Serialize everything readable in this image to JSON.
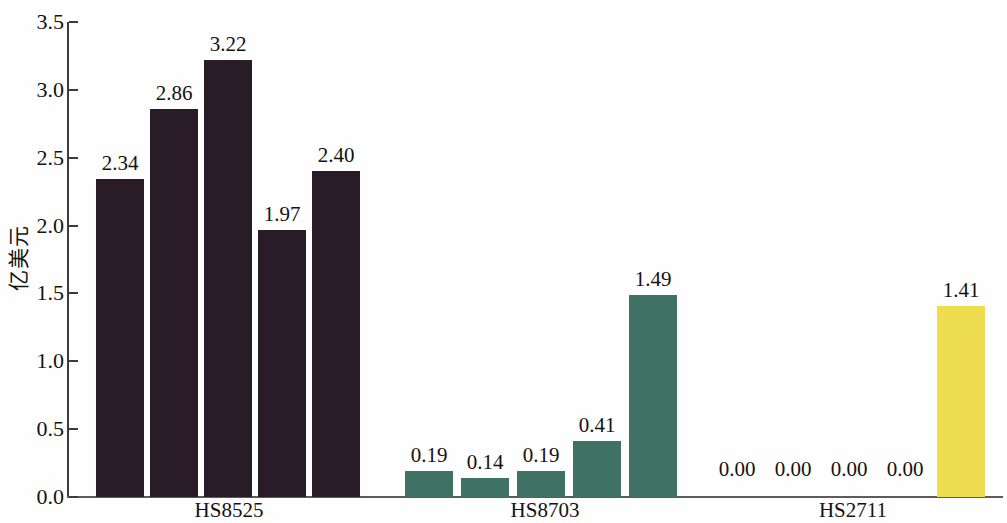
{
  "chart_data": {
    "type": "bar",
    "title": "",
    "subtitle": "",
    "xlabel": "",
    "ylabel": "亿美元",
    "ylim": [
      0.0,
      3.5
    ],
    "ytick_labels": [
      "0.0",
      "0.5",
      "1.0",
      "1.5",
      "2.0",
      "2.5",
      "3.0",
      "3.5"
    ],
    "ytick_values": [
      0.0,
      0.5,
      1.0,
      1.5,
      2.0,
      2.5,
      3.0,
      3.5
    ],
    "grid": false,
    "legend": false,
    "legend_position": "none",
    "categories": [
      "HS8525",
      "HS8703",
      "HS2711"
    ],
    "bars_per_category": 5,
    "groups": [
      {
        "label": "HS8525",
        "color": "#2a1c26",
        "values": [
          2.34,
          2.86,
          3.22,
          1.97,
          2.4
        ],
        "value_labels": [
          "2.34",
          "2.86",
          "3.22",
          "1.97",
          "2.40"
        ]
      },
      {
        "label": "HS8703",
        "color": "#3f7265",
        "values": [
          0.19,
          0.14,
          0.19,
          0.41,
          1.49
        ],
        "value_labels": [
          "0.19",
          "0.14",
          "0.19",
          "0.41",
          "1.49"
        ]
      },
      {
        "label": "HS2711",
        "color": "#eedd4f",
        "values": [
          0.0,
          0.0,
          0.0,
          0.0,
          1.41
        ],
        "value_labels": [
          "0.00",
          "0.00",
          "0.00",
          "0.00",
          "1.41"
        ]
      }
    ]
  }
}
